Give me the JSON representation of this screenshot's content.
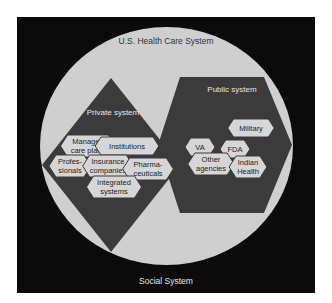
{
  "diagram": {
    "outer_label": "Social System",
    "circle_label": "U.S. Health Care System",
    "private": {
      "label": "Private system",
      "nodes": [
        {
          "id": "managed",
          "lines": [
            "Managed",
            "care plans"
          ],
          "cx": 88,
          "cy": 146
        },
        {
          "id": "institutions",
          "lines": [
            "Institutions"
          ],
          "cx": 127,
          "cy": 146
        },
        {
          "id": "professionals",
          "lines": [
            "Profes-",
            "sionals"
          ],
          "cx": 70,
          "cy": 166
        },
        {
          "id": "insurance",
          "lines": [
            "Insurance",
            "companies"
          ],
          "cx": 108,
          "cy": 166
        },
        {
          "id": "pharma",
          "lines": [
            "Pharma-",
            "ceuticals"
          ],
          "cx": 148,
          "cy": 169
        },
        {
          "id": "integrated",
          "lines": [
            "Integrated",
            "systems"
          ],
          "cx": 114,
          "cy": 187
        }
      ]
    },
    "public": {
      "label": "Public system",
      "nodes": [
        {
          "id": "military",
          "lines": [
            "Military"
          ],
          "cx": 251,
          "cy": 128
        },
        {
          "id": "va",
          "lines": [
            "VA"
          ],
          "cx": 200,
          "cy": 147
        },
        {
          "id": "fda",
          "lines": [
            "FDA"
          ],
          "cx": 235,
          "cy": 149
        },
        {
          "id": "other",
          "lines": [
            "Other",
            "agencies"
          ],
          "cx": 211,
          "cy": 164
        },
        {
          "id": "indian",
          "lines": [
            "Indian",
            "Health"
          ],
          "cx": 248,
          "cy": 167
        }
      ]
    },
    "colors": {
      "background": "#0b0b0b",
      "circle": "#cfcfcf",
      "system_fill": "#3b3b3b",
      "node_fill": "#d6d6d6",
      "node_stroke": "#3b3b3b",
      "light_text": "#e6e6e6",
      "dark_text": "#222222"
    }
  }
}
